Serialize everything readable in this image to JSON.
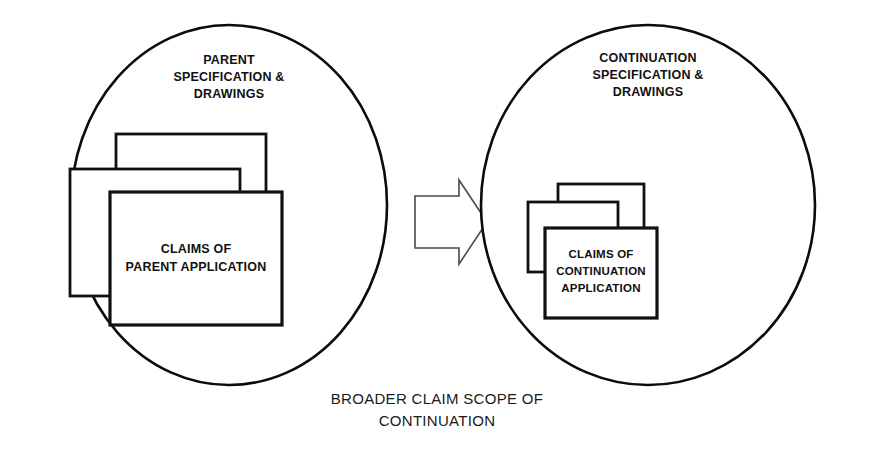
{
  "diagram": {
    "background_color": "#ffffff",
    "line_color": "#111111",
    "arrow_line_color": "#4a4a4a",
    "caption": {
      "line1": "BROADER  CLAIM SCOPE OF",
      "line2": "CONTINUATION"
    },
    "left_group": {
      "heading": {
        "line1": "PARENT",
        "line2": "SPECIFICATION &",
        "line3": "DRAWINGS"
      },
      "claims_box_label": {
        "line1": "CLAIMS OF",
        "line2": "PARENT APPLICATION"
      },
      "stack_count": 3
    },
    "right_group": {
      "heading": {
        "line1": "CONTINUATION",
        "line2": "SPECIFICATION &",
        "line3": "DRAWINGS"
      },
      "claims_box_label": {
        "line1": "CLAIMS OF",
        "line2": "CONTINUATION",
        "line3": "APPLICATION"
      },
      "stack_count": 3
    },
    "arrow": {
      "direction": "right",
      "style": "hollow-block-arrow"
    }
  }
}
